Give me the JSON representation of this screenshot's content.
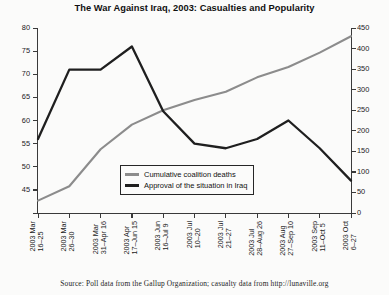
{
  "chart_data": {
    "type": "line",
    "title": "The War Against Iraq, 2003: Casualties and Popularity",
    "xlabel": "",
    "ylabel": "Approval of the situation in Iraq (%)",
    "y2label": "Cumulative coalition deaths",
    "ylim": [
      40,
      80
    ],
    "y2lim": [
      0,
      450
    ],
    "yticks": [
      40,
      45,
      50,
      55,
      60,
      65,
      70,
      75,
      80
    ],
    "y2ticks": [
      0,
      50,
      100,
      150,
      200,
      250,
      300,
      350,
      400,
      450
    ],
    "grid": false,
    "legend_position": "center",
    "categories": [
      "2003 Mar 16–25",
      "2003 Mar 26–30",
      "2003 Mar 31–Apr 16",
      "2003 Apr 17–Jun 15",
      "2003 Jun 16–Jul 9",
      "2003 Jul 10–20",
      "2003 Jul 21–27",
      "2003 Jul 28–Aug 26",
      "2003 Aug 27–Sep 10",
      "2003 Sep 11–Oct 5",
      "2003 Oct 6–27"
    ],
    "series": [
      {
        "name": "Cumulative coalition deaths",
        "axis": "right",
        "color": "#8c8c8c",
        "values": [
          30,
          65,
          155,
          215,
          250,
          275,
          295,
          330,
          355,
          390,
          430
        ]
      },
      {
        "name": "Approval of the situation in Iraq",
        "axis": "left",
        "color": "#1f1f1f",
        "values": [
          56,
          71,
          71,
          76,
          62,
          55,
          54,
          56,
          60,
          54,
          47
        ]
      }
    ],
    "source_note": "Source: Poll data from the Gallup Organization; casualty data from http://lunaville.org"
  },
  "legend": {
    "items": [
      {
        "label": "Cumulative coalition deaths",
        "color": "#8c8c8c"
      },
      {
        "label": "Approval of the situation in Iraq",
        "color": "#1f1f1f"
      }
    ]
  },
  "axis_labels_left": [
    "80",
    "75",
    "70",
    "65",
    "60",
    "55",
    "50",
    "45",
    "40"
  ],
  "axis_labels_right": [
    "450",
    "400",
    "350",
    "300",
    "250",
    "200",
    "150",
    "100",
    "50",
    "0"
  ]
}
